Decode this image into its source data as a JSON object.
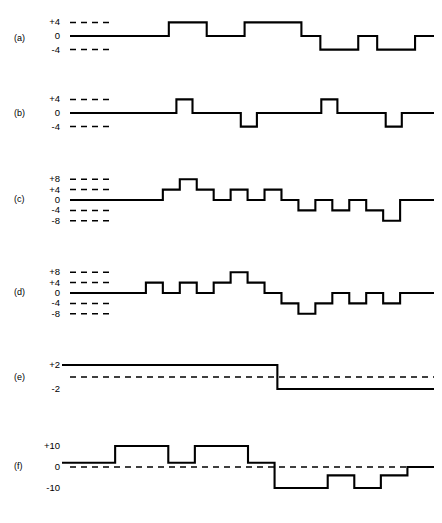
{
  "figure": {
    "background_color": "#ffffff",
    "trace_color": "#000000",
    "width": 442,
    "height": 523
  },
  "panels": [
    {
      "id": "a",
      "label": "(a)",
      "tick_labels": [
        "+4",
        "0",
        "-4"
      ],
      "dashed_levels": [
        4,
        -4
      ],
      "solid_zero_lead": true,
      "zero_dashed_full_width": false,
      "steps": [
        0,
        0,
        0,
        4,
        4,
        0,
        0,
        4,
        4,
        4,
        0,
        -4,
        -4,
        0,
        -4,
        -4,
        0
      ],
      "ylim": [
        -6,
        6
      ]
    },
    {
      "id": "b",
      "label": "(b)",
      "tick_labels": [
        "+4",
        "0",
        "-4"
      ],
      "dashed_levels": [
        4,
        -4
      ],
      "solid_zero_lead": true,
      "zero_dashed_full_width": false,
      "steps": [
        0,
        0,
        0,
        0,
        4,
        0,
        0,
        0,
        -4,
        0,
        0,
        0,
        0,
        4,
        0,
        0,
        0,
        -4,
        0,
        0
      ],
      "ylim": [
        -6,
        6
      ]
    },
    {
      "id": "c",
      "label": "(c)",
      "tick_labels": [
        "+8",
        "+4",
        "0",
        "-4",
        "-8"
      ],
      "dashed_levels": [
        8,
        4,
        -4,
        -8
      ],
      "solid_zero_lead": true,
      "zero_dashed_full_width": false,
      "steps": [
        0,
        0,
        0,
        4,
        8,
        4,
        0,
        4,
        0,
        4,
        0,
        -4,
        0,
        -4,
        0,
        -4,
        -8,
        0,
        0
      ],
      "ylim": [
        -10,
        10
      ]
    },
    {
      "id": "d",
      "label": "(d)",
      "tick_labels": [
        "+8",
        "+4",
        "0",
        "-4",
        "-8"
      ],
      "dashed_levels": [
        8,
        4,
        -4,
        -8
      ],
      "solid_zero_lead": true,
      "zero_dashed_full_width": false,
      "steps": [
        0,
        0,
        4,
        0,
        4,
        0,
        4,
        8,
        4,
        0,
        -4,
        -8,
        -4,
        0,
        -4,
        0,
        -4,
        0,
        0
      ],
      "ylim": [
        -10,
        10
      ]
    },
    {
      "id": "e",
      "label": "(e)",
      "tick_labels": [
        "+2",
        "-2"
      ],
      "dashed_levels": [
        0
      ],
      "solid_zero_lead": false,
      "zero_dashed_full_width": true,
      "steps": [
        2,
        2,
        2,
        2,
        2,
        2,
        2,
        2,
        2,
        2,
        2,
        -2,
        -2,
        -2,
        -2,
        -2,
        -2,
        -2,
        -2
      ],
      "ylim": [
        -4,
        4
      ]
    },
    {
      "id": "f",
      "label": "(f)",
      "tick_labels": [
        "+10",
        "0",
        "-10"
      ],
      "dashed_levels": [
        0
      ],
      "solid_zero_lead": false,
      "zero_dashed_full_width": true,
      "steps": [
        2,
        2,
        10,
        10,
        2,
        10,
        10,
        2,
        -10,
        -10,
        -4,
        -10,
        -4,
        0
      ],
      "ylim": [
        -14,
        14
      ]
    }
  ],
  "chart_data": {
    "type": "line",
    "xlabel": "",
    "ylabel": "",
    "grid": "dashed horizontal reference lines only",
    "legend": "none",
    "series": [
      {
        "name": "(a)",
        "values": [
          0,
          0,
          0,
          4,
          4,
          0,
          0,
          4,
          4,
          4,
          0,
          -4,
          -4,
          0,
          -4,
          -4,
          0
        ],
        "ylim": [
          -6,
          6
        ],
        "tick_labels": [
          "+4",
          "0",
          "-4"
        ]
      },
      {
        "name": "(b)",
        "values": [
          0,
          0,
          0,
          0,
          4,
          0,
          0,
          0,
          -4,
          0,
          0,
          0,
          0,
          4,
          0,
          0,
          0,
          -4,
          0,
          0
        ],
        "ylim": [
          -6,
          6
        ],
        "tick_labels": [
          "+4",
          "0",
          "-4"
        ]
      },
      {
        "name": "(c)",
        "values": [
          0,
          0,
          0,
          4,
          8,
          4,
          0,
          4,
          0,
          4,
          0,
          -4,
          0,
          -4,
          0,
          -4,
          -8,
          0,
          0
        ],
        "ylim": [
          -10,
          10
        ],
        "tick_labels": [
          "+8",
          "+4",
          "0",
          "-4",
          "-8"
        ]
      },
      {
        "name": "(d)",
        "values": [
          0,
          0,
          4,
          0,
          4,
          0,
          4,
          8,
          4,
          0,
          -4,
          -8,
          -4,
          0,
          -4,
          0,
          -4,
          0,
          0
        ],
        "ylim": [
          -10,
          10
        ],
        "tick_labels": [
          "+8",
          "+4",
          "0",
          "-4",
          "-8"
        ]
      },
      {
        "name": "(e)",
        "values": [
          2,
          2,
          2,
          2,
          2,
          2,
          2,
          2,
          2,
          2,
          2,
          -2,
          -2,
          -2,
          -2,
          -2,
          -2,
          -2,
          -2
        ],
        "ylim": [
          -4,
          4
        ],
        "tick_labels": [
          "+2",
          "-2"
        ]
      },
      {
        "name": "(f)",
        "values": [
          2,
          2,
          10,
          10,
          2,
          10,
          10,
          2,
          -10,
          -10,
          -4,
          -10,
          -4,
          0
        ],
        "ylim": [
          -14,
          14
        ],
        "tick_labels": [
          "+10",
          "0",
          "-10"
        ]
      }
    ]
  }
}
